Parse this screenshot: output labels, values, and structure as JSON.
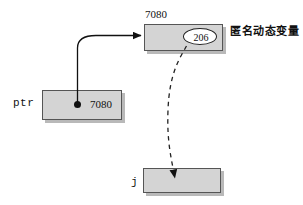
{
  "diagram": {
    "colors": {
      "box_fill": "#d4d4d4",
      "box_border": "#555555",
      "shadow": "#b9b9b9",
      "line": "#111111",
      "oval_fill": "#ffffff",
      "text": "#111111"
    },
    "heap_box": {
      "address_label": "7080",
      "value": "206",
      "annotation": "匿名动态变量"
    },
    "pointer_box": {
      "name": "ptr",
      "value": "7080"
    },
    "target_box": {
      "name": "j",
      "value": ""
    },
    "edges": {
      "solid_arrow_name": "ptr-to-heap-arrow",
      "dashed_arrow_name": "heap-value-to-j-arrow"
    }
  }
}
